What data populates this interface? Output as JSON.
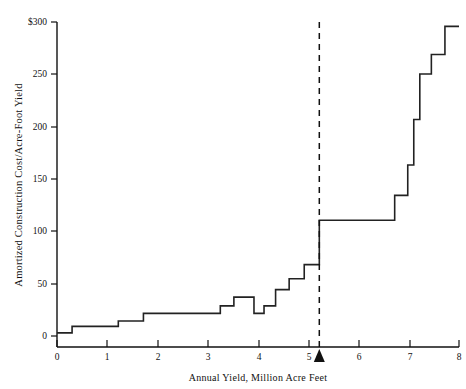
{
  "chart_data": {
    "type": "line",
    "subtype": "step",
    "title": "",
    "xlabel": "Annual Yield, Million Acre Feet",
    "ylabel": "Amortized Construction Cost/Acre-Foot Yield",
    "xlim": [
      0,
      8
    ],
    "ylim": [
      0,
      300
    ],
    "xticks": [
      0,
      1,
      2,
      3,
      4,
      5,
      6,
      7,
      8
    ],
    "xtick_labels": [
      "0",
      "1",
      "2",
      "3",
      "4",
      "5",
      "6",
      "7",
      "8"
    ],
    "yticks": [
      0,
      50,
      100,
      150,
      200,
      250,
      300
    ],
    "ytick_labels": [
      "0",
      "50",
      "100",
      "150",
      "200",
      "250",
      "$300"
    ],
    "grid": false,
    "legend": null,
    "line_color": "#222222",
    "steps": [
      {
        "x_start": 0.0,
        "x_end": 0.3,
        "y": 13
      },
      {
        "x_start": 0.3,
        "x_end": 1.22,
        "y": 19
      },
      {
        "x_start": 1.22,
        "x_end": 1.72,
        "y": 24
      },
      {
        "x_start": 1.72,
        "x_end": 3.25,
        "y": 31
      },
      {
        "x_start": 3.25,
        "x_end": 3.52,
        "y": 38
      },
      {
        "x_start": 3.52,
        "x_end": 3.92,
        "y": 46
      },
      {
        "x_start": 3.92,
        "x_end": 4.12,
        "y": 31
      },
      {
        "x_start": 4.12,
        "x_end": 4.35,
        "y": 38
      },
      {
        "x_start": 4.35,
        "x_end": 4.62,
        "y": 53
      },
      {
        "x_start": 4.62,
        "x_end": 4.92,
        "y": 63
      },
      {
        "x_start": 4.92,
        "x_end": 5.22,
        "y": 76
      },
      {
        "x_start": 5.22,
        "x_end": 6.72,
        "y": 117
      },
      {
        "x_start": 6.72,
        "x_end": 6.98,
        "y": 140
      },
      {
        "x_start": 6.98,
        "x_end": 7.1,
        "y": 168
      },
      {
        "x_start": 7.1,
        "x_end": 7.22,
        "y": 210
      },
      {
        "x_start": 7.22,
        "x_end": 7.45,
        "y": 252
      },
      {
        "x_start": 7.45,
        "x_end": 7.72,
        "y": 270
      },
      {
        "x_start": 7.72,
        "x_end": 8.0,
        "y": 296
      }
    ],
    "annotations": [
      {
        "name": "planning-target-line",
        "type": "vline",
        "x": 5.22,
        "style": "dashed"
      },
      {
        "name": "planning-target-marker",
        "type": "triangle-up",
        "x": 5.22,
        "y": 0
      }
    ]
  }
}
